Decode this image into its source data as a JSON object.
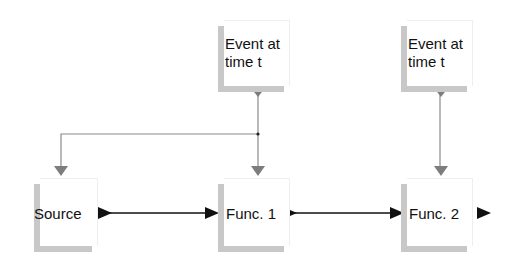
{
  "diagram": {
    "nodes": [
      {
        "id": "event1",
        "label": "Event at\ntime t",
        "x": 224,
        "y": 20,
        "w": 66,
        "h": 66
      },
      {
        "id": "event2",
        "label": "Event at\ntime t",
        "x": 407,
        "y": 20,
        "w": 66,
        "h": 66
      },
      {
        "id": "source",
        "label": "Source",
        "x": 40,
        "y": 178,
        "w": 58,
        "h": 68
      },
      {
        "id": "func1",
        "label": "Func. 1",
        "x": 224,
        "y": 178,
        "w": 66,
        "h": 68
      },
      {
        "id": "func2",
        "label": "Func. 2",
        "x": 407,
        "y": 178,
        "w": 66,
        "h": 68
      }
    ],
    "edges": [
      {
        "from": "event1",
        "to": "func1",
        "type": "event",
        "color": "#888888"
      },
      {
        "from": "event1",
        "to": "source",
        "type": "event",
        "color": "#888888"
      },
      {
        "from": "event2",
        "to": "func2",
        "type": "event",
        "color": "#888888"
      },
      {
        "from": "source",
        "to": "func1",
        "type": "data",
        "color": "#111111"
      },
      {
        "from": "func1",
        "to": "func2",
        "type": "data",
        "color": "#111111"
      },
      {
        "from": "func2",
        "to": "output",
        "type": "data",
        "color": "#111111"
      }
    ],
    "colors": {
      "event_edge": "#888888",
      "data_edge": "#111111",
      "shadow": "#c8c8c8"
    }
  }
}
